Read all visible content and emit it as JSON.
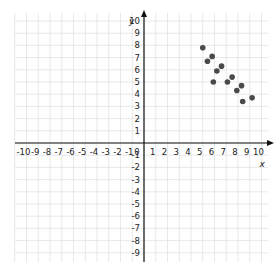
{
  "chart_data": {
    "type": "scatter",
    "title": "",
    "xlabel": "x",
    "ylabel": "y",
    "xlim": [
      -10,
      10
    ],
    "ylim": [
      -9,
      10
    ],
    "grid": true,
    "legend": null,
    "x_ticks": [
      -10,
      -9,
      -8,
      -7,
      -6,
      -5,
      -4,
      -3,
      -2,
      -1,
      0,
      1,
      2,
      3,
      4,
      5,
      6,
      7,
      8,
      9,
      10
    ],
    "y_ticks": [
      10,
      9,
      8,
      7,
      6,
      5,
      4,
      3,
      2,
      1,
      -1,
      -2,
      -3,
      -4,
      -5,
      -6,
      -7,
      -8,
      -9
    ],
    "series": [
      {
        "name": "points",
        "color": "#4a4a4a",
        "points": [
          {
            "x": 5.0,
            "y": 7.8
          },
          {
            "x": 5.8,
            "y": 7.1
          },
          {
            "x": 5.4,
            "y": 6.7
          },
          {
            "x": 6.6,
            "y": 6.3
          },
          {
            "x": 6.2,
            "y": 5.9
          },
          {
            "x": 5.9,
            "y": 5.0
          },
          {
            "x": 7.5,
            "y": 5.4
          },
          {
            "x": 7.1,
            "y": 5.0
          },
          {
            "x": 8.3,
            "y": 4.7
          },
          {
            "x": 7.9,
            "y": 4.3
          },
          {
            "x": 9.2,
            "y": 3.7
          },
          {
            "x": 8.4,
            "y": 3.4
          }
        ]
      }
    ]
  },
  "colors": {
    "grid": "#e2e2e2",
    "axis": "#111111",
    "point": "#4a4a4a"
  }
}
